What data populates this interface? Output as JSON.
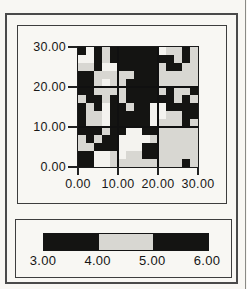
{
  "figure": {
    "colors": {
      "page_background": "#f8f7f3",
      "frame": "#4a4a4a",
      "class_black": "#141412",
      "class_gray": "#d8d7d2",
      "class_white": "#f4f3ef",
      "gridline": "#101010"
    }
  },
  "axes": {
    "y_ticks": [
      "30.00",
      "20.00",
      "10.00",
      "0.00"
    ],
    "x_ticks": [
      "0.00",
      "10.00",
      "20.00",
      "30.00"
    ],
    "x_range": [
      0,
      30
    ],
    "y_range": [
      0,
      30
    ]
  },
  "legend": {
    "labels": [
      "3.00",
      "4.00",
      "5.00",
      "6.00"
    ],
    "segments": [
      {
        "from": "3.00",
        "to": "4.00",
        "color": "#141412"
      },
      {
        "from": "4.00",
        "to": "5.00",
        "color": "#d8d7d2"
      },
      {
        "from": "5.00",
        "to": "6.00",
        "color": "#141412"
      }
    ]
  },
  "chart_data": {
    "type": "heatmap",
    "title": "",
    "xlabel": "",
    "ylabel": "",
    "x_range": [
      0,
      30
    ],
    "y_range": [
      0,
      30
    ],
    "x_tick_values": [
      0,
      10,
      20,
      30
    ],
    "y_tick_values": [
      0,
      10,
      20,
      30
    ],
    "gridlines_at": [
      10,
      20
    ],
    "legend_breaks": [
      3,
      4,
      5,
      6
    ],
    "cell_size_units": 2,
    "class_colors": {
      "W": "#f4f3ef",
      "G": "#d8d7d2",
      "B": "#141412"
    },
    "class_meaning": {
      "B": "value in 3.00-4.00 or 5.00-6.00 (black)",
      "G": "value in 4.00-5.00 (light gray)",
      "W": "unclassed / background (white)"
    },
    "grid_rows_top_to_bottom": [
      "BWBGBBBBBBWGGBG",
      "WWBGBBBBBBBBGBG",
      "GGBWWBBBBBGBBGG",
      "BBGGGGGBBBGGGGG",
      "BBGWGGBBBBGGGGG",
      "BBGGGGBBBBGBGGB",
      "GBBGBGBBBBBBGBG",
      "BGBWBBGBBWWBBBB",
      "BGGWBBBBBWWGGBB",
      "BGGWBBBBBWGGGBG",
      "BBBGBBWWBBGGGGG",
      "GBGBBWWWWGGGGGG",
      "GGBBBWWWBBGGGGG",
      "BBWWGWGGBBGGGGG",
      "BBWWGGGGGGGGGBG"
    ]
  }
}
